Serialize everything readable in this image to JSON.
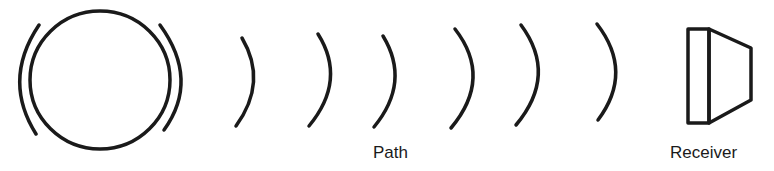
{
  "diagram": {
    "type": "signal-propagation",
    "stroke_color": "#1a1a1a",
    "background": "#ffffff",
    "source": {
      "shape": "circle-with-emission-arcs",
      "label": ""
    },
    "path": {
      "label": "Path",
      "wave_count": 6
    },
    "receiver": {
      "shape": "trapezoid-horn",
      "label": "Receiver"
    }
  }
}
